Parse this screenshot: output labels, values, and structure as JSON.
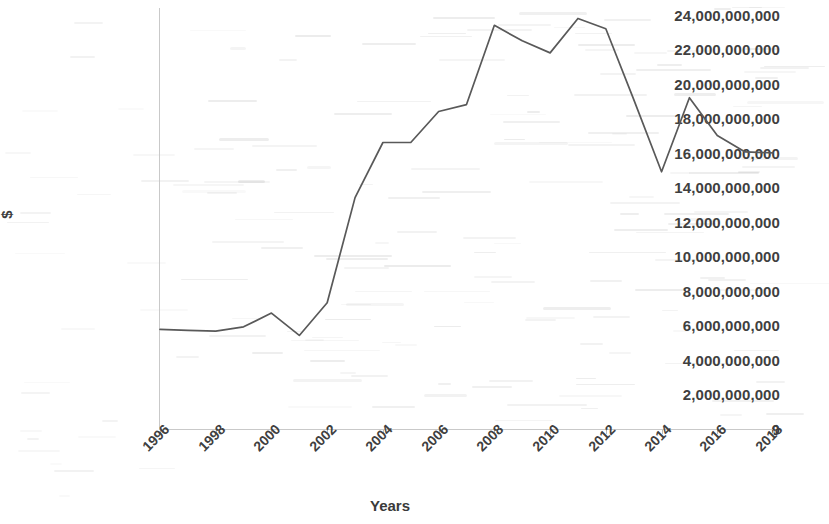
{
  "chart_data": {
    "type": "line",
    "title": "",
    "xlabel": "Years",
    "ylabel": "$",
    "x": [
      1996,
      1997,
      1998,
      1999,
      2000,
      2001,
      2002,
      2003,
      2004,
      2005,
      2006,
      2007,
      2008,
      2009,
      2010,
      2011,
      2012,
      2013,
      2014,
      2015,
      2016,
      2017,
      2018
    ],
    "values": [
      5750000000,
      5700000000,
      5650000000,
      5900000000,
      6700000000,
      5400000000,
      7300000000,
      13400000000,
      16600000000,
      16600000000,
      18400000000,
      18800000000,
      23400000000,
      22500000000,
      21800000000,
      23800000000,
      23200000000,
      19100000000,
      14900000000,
      19200000000,
      17000000000,
      16050000000,
      16000000000
    ],
    "series": [
      {
        "name": "",
        "values": [
          5750000000,
          5700000000,
          5650000000,
          5900000000,
          6700000000,
          5400000000,
          7300000000,
          13400000000,
          16600000000,
          16600000000,
          18400000000,
          18800000000,
          23400000000,
          22500000000,
          21800000000,
          23800000000,
          23200000000,
          19100000000,
          14900000000,
          19200000000,
          17000000000,
          16050000000,
          16000000000
        ]
      }
    ],
    "ylim": [
      0,
      24000000000
    ],
    "xlim": [
      1996,
      2018
    ],
    "ytick_labels": [
      "24,000,000,000",
      "22,000,000,000",
      "20,000,000,000",
      "18,000,000,000",
      "16,000,000,000",
      "14,000,000,000",
      "12,000,000,000",
      "10,000,000,000",
      "8,000,000,000",
      "6,000,000,000",
      "4,000,000,000",
      "2,000,000,000",
      "0"
    ],
    "ytick_values": [
      24000000000,
      22000000000,
      20000000000,
      18000000000,
      16000000000,
      14000000000,
      12000000000,
      10000000000,
      8000000000,
      6000000000,
      4000000000,
      2000000000,
      0
    ],
    "xtick_labels": [
      "1996",
      "1998",
      "2000",
      "2002",
      "2004",
      "2006",
      "2008",
      "2010",
      "2012",
      "2014",
      "2016",
      "2018"
    ],
    "xtick_values": [
      1996,
      1998,
      2000,
      2002,
      2004,
      2006,
      2008,
      2010,
      2012,
      2014,
      2016,
      2018
    ],
    "grid": false,
    "legend": false,
    "line_color": "#595959",
    "text_color": "#3f3f3f",
    "background_color": "#ffffff"
  }
}
